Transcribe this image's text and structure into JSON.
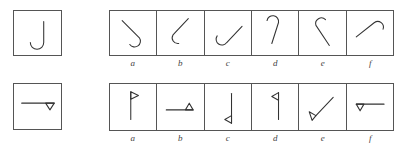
{
  "rows": [
    {
      "name": "hook-rotation-row",
      "reference": {
        "name": "reference-hook-j",
        "glyph": "J-shaped hook"
      },
      "options": [
        {
          "label": "a",
          "glyph": "hook rotated, curl bottom-right"
        },
        {
          "label": "b",
          "glyph": "hook rotated, curl bottom-left"
        },
        {
          "label": "c",
          "glyph": "hook rotated, curl left, stem up-right"
        },
        {
          "label": "d",
          "glyph": "hook inverted, curl top-right"
        },
        {
          "label": "e",
          "glyph": "hook inverted, curl top-left"
        },
        {
          "label": "f",
          "glyph": "hook rotated, curl top-right, stem down-left"
        }
      ]
    },
    {
      "name": "flag-rotation-row",
      "reference": {
        "name": "reference-flag-horizontal",
        "glyph": "horizontal line with triangle pointing down at right end"
      },
      "options": [
        {
          "label": "a",
          "glyph": "vertical pole with flag at top pointing right"
        },
        {
          "label": "b",
          "glyph": "horizontal line with triangle pointing up at right end"
        },
        {
          "label": "c",
          "glyph": "vertical line with triangle pointing left at bottom"
        },
        {
          "label": "d",
          "glyph": "vertical pole with flag at top pointing left"
        },
        {
          "label": "e",
          "glyph": "diagonal line with triangle at lower-left"
        },
        {
          "label": "f",
          "glyph": "horizontal line with triangle pointing down at left end"
        }
      ]
    }
  ],
  "colors": {
    "stroke": "#333333",
    "border": "#555555",
    "background": "#ffffff"
  }
}
